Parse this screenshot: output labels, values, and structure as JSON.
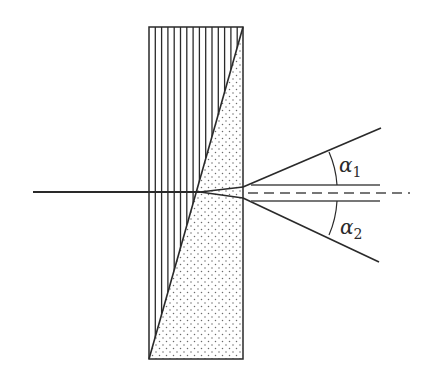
{
  "diagram": {
    "type": "Wollaston prism beam splitting",
    "colors": {
      "stroke": "#2a2a2a",
      "hatch": "#2a2a2a",
      "dots": "#6a6a6a",
      "background": "#ffffff"
    },
    "prism": {
      "box": {
        "x": 149,
        "y": 27,
        "width": 94,
        "height": 332
      },
      "diagonal": {
        "x1": 243,
        "y1": 27,
        "x2": 149,
        "y2": 359
      },
      "left_region_fill": "vertical-hatch",
      "right_region_fill": "dotted"
    },
    "incident_ray": {
      "x1": 33,
      "y1": 192,
      "x2": 200,
      "y2": 192
    },
    "inner_rays": {
      "upper": {
        "x1": 200,
        "y1": 192,
        "x2": 243,
        "y2": 187
      },
      "lower": {
        "x1": 200,
        "y1": 192,
        "x2": 243,
        "y2": 198
      }
    },
    "exit_rays": {
      "upper": {
        "x1": 243,
        "y1": 187,
        "x2": 381,
        "y2": 128
      },
      "lower": {
        "x1": 243,
        "y1": 198,
        "x2": 379,
        "y2": 262
      }
    },
    "reference_lines": {
      "upper_parallel": {
        "x1": 251,
        "y1": 185,
        "x2": 380,
        "y2": 185
      },
      "lower_parallel": {
        "x1": 251,
        "y1": 201,
        "x2": 380,
        "y2": 201
      },
      "center_dashed": {
        "x1": 248,
        "y1": 193,
        "x2": 410,
        "y2": 193
      }
    },
    "angle_labels": [
      {
        "symbol": "α",
        "subscript": "1",
        "x": 339,
        "y": 172
      },
      {
        "symbol": "α",
        "subscript": "2",
        "x": 340,
        "y": 234
      }
    ],
    "hatch_spacing": 6.3
  }
}
